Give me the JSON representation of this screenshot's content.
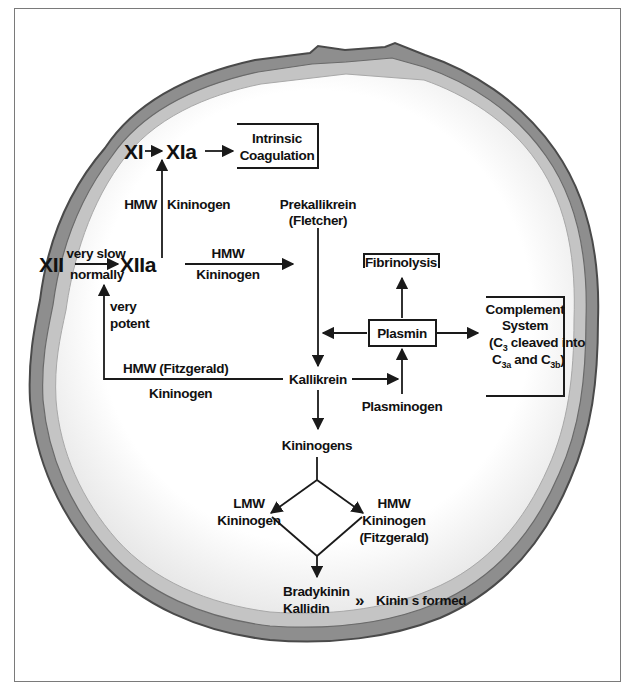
{
  "diagram": {
    "nodes": {
      "xi": "XI",
      "xia": "XIa",
      "xii": "XII",
      "xiia": "XIIa",
      "intrinsic_line1": "Intrinsic",
      "intrinsic_line2": "Coagulation",
      "prekallikrein_line1": "Prekallikrein",
      "prekallikrein_line2": "(Fletcher)",
      "fibrinolysis": "Fibrinolysis",
      "plasmin": "Plasmin",
      "complement_line1": "Complement",
      "complement_line2": "System",
      "complement_line3": "(C",
      "complement_line3_sub": "3",
      "complement_line3_rest": " cleaved into",
      "complement_line4a": "C",
      "complement_line4a_sub": "3a",
      "complement_line4b": " and C",
      "complement_line4b_sub": "3b",
      "complement_line4_end": ")",
      "kallikrein": "Kallikrein",
      "plasminogen": "Plasminogen",
      "kininogens": "Kininogens",
      "lmw_line1": "LMW",
      "lmw_line2": "Kininogen",
      "hmw_line1": "HMW",
      "hmw_line2": "Kininogen",
      "hmw_line3": "(Fitzgerald)",
      "bradykinin": "Bradykinin",
      "kallidin": "Kallidin",
      "kinins_formed": "Kinin s formed"
    },
    "edge_labels": {
      "hmw_left": "HMW",
      "kininogen_right": "Kininogen",
      "very_slow": "very slow",
      "normally": "normally",
      "hmw_top": "HMW",
      "kininogen_bottom": "Kininogen",
      "very": "very",
      "potent": "potent",
      "hmw_fitzgerald": "HMW (Fitzgerald)",
      "kininogen_feedback": "Kininogen",
      "double_chevron": "»"
    },
    "colors": {
      "ink": "#1a1a1a",
      "frame": "#7a7a7a",
      "rim_dark": "#5a5a5a",
      "rim_mid": "#9a9a9a",
      "rim_light": "#c8c8c8",
      "interior": "#fafafa"
    }
  }
}
